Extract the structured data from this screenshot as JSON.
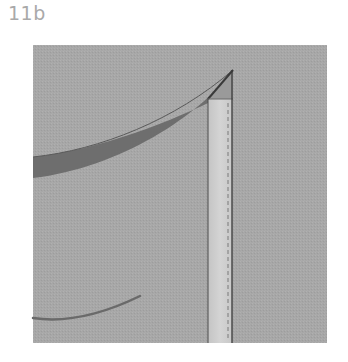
{
  "figure": {
    "label": "11b"
  },
  "colors": {
    "background": "#ffffff",
    "fabric": "#a6a6a6",
    "facing_strip": "#cfcfcf",
    "curve_band": "#6b6b6b",
    "outline": "#3c3c3c",
    "stitch": "#808080",
    "label": "#a9a9a9"
  },
  "elements": {
    "fabric_panel": "Gray fabric square",
    "facing_strip": "Light vertical strip with dashed stitching line",
    "upper_curve": "Dark curved band (cut edge)",
    "lower_curve": "Thin dark curve"
  }
}
